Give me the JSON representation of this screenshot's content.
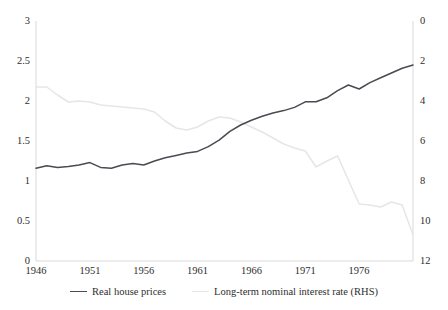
{
  "chart_data": {
    "type": "line",
    "title": "",
    "xlabel": "",
    "ylabel": "",
    "grid": false,
    "legend_position": "bottom",
    "xlim": [
      1946,
      1981
    ],
    "x_ticks": [
      "1946",
      "1951",
      "1956",
      "1961",
      "1966",
      "1971",
      "1976"
    ],
    "x_tick_values": [
      1946,
      1951,
      1956,
      1961,
      1966,
      1971,
      1976
    ],
    "left_axis": {
      "label": "",
      "ylim": [
        0,
        3
      ],
      "inverted": false,
      "ticks": [
        "0",
        "0.5",
        "1",
        "1.5",
        "2",
        "2.5",
        "3"
      ],
      "tick_values": [
        0,
        0.5,
        1,
        1.5,
        2,
        2.5,
        3
      ]
    },
    "right_axis": {
      "label": "",
      "ylim": [
        0,
        12
      ],
      "inverted": true,
      "ticks": [
        "0",
        "2",
        "4",
        "6",
        "8",
        "10",
        "12"
      ],
      "tick_values": [
        0,
        2,
        4,
        6,
        8,
        10,
        12
      ]
    },
    "x": [
      1946,
      1947,
      1948,
      1949,
      1950,
      1951,
      1952,
      1953,
      1954,
      1955,
      1956,
      1957,
      1958,
      1959,
      1960,
      1961,
      1962,
      1963,
      1964,
      1965,
      1966,
      1967,
      1968,
      1969,
      1970,
      1971,
      1972,
      1973,
      1974,
      1975,
      1976,
      1977,
      1978,
      1979,
      1980,
      1981
    ],
    "series": [
      {
        "name": "Real house prices",
        "axis": "left",
        "color": "#4a4a52",
        "values": [
          1.16,
          1.19,
          1.17,
          1.18,
          1.2,
          1.23,
          1.17,
          1.16,
          1.2,
          1.22,
          1.2,
          1.25,
          1.29,
          1.32,
          1.35,
          1.37,
          1.43,
          1.51,
          1.62,
          1.7,
          1.76,
          1.81,
          1.85,
          1.88,
          1.92,
          1.99,
          1.99,
          2.04,
          2.13,
          2.2,
          2.15,
          2.23,
          2.29,
          2.35,
          2.41,
          2.45
        ]
      },
      {
        "name": "Long-term nominal interest rate (RHS)",
        "axis": "right",
        "color": "#e6e6e6",
        "values": [
          3.3,
          3.3,
          3.7,
          4.05,
          4.0,
          4.05,
          4.2,
          4.25,
          4.3,
          4.35,
          4.4,
          4.55,
          5.0,
          5.35,
          5.45,
          5.3,
          5.0,
          4.8,
          4.85,
          5.05,
          5.3,
          5.55,
          5.85,
          6.15,
          6.35,
          6.5,
          7.3,
          7.0,
          6.75,
          7.95,
          9.15,
          9.2,
          9.3,
          9.05,
          9.2,
          10.7
        ]
      }
    ]
  }
}
